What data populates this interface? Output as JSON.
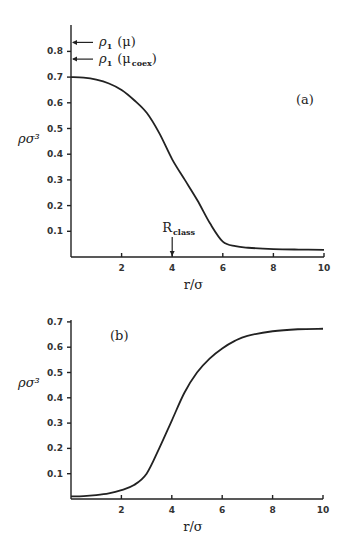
{
  "chart_data": [
    {
      "type": "line",
      "panel_label": "(a)",
      "xlabel": "r/σ",
      "ylabel": "ρσ³",
      "xlim": [
        0,
        10
      ],
      "ylim": [
        0,
        0.9
      ],
      "x_ticks": [
        2,
        4,
        6,
        8,
        10
      ],
      "y_ticks": [
        0.1,
        0.2,
        0.3,
        0.4,
        0.5,
        0.6,
        0.7,
        0.8
      ],
      "grid": false,
      "series": [
        {
          "name": "density profile (a)",
          "x": [
            0,
            0.5,
            1,
            1.5,
            2,
            2.5,
            3,
            3.5,
            4,
            4.5,
            5,
            5.5,
            6,
            6.5,
            7,
            8,
            9,
            10
          ],
          "values": [
            0.7,
            0.698,
            0.69,
            0.675,
            0.65,
            0.61,
            0.56,
            0.48,
            0.38,
            0.3,
            0.22,
            0.13,
            0.06,
            0.042,
            0.036,
            0.031,
            0.029,
            0.028
          ]
        }
      ],
      "annotations": [
        {
          "text": "ρ",
          "sub": "1",
          "suffix": "(μ)",
          "y": 0.835,
          "type": "arrow-left"
        },
        {
          "text": "ρ",
          "sub": "1",
          "suffix": "(μ",
          "suffix_sub": "coex",
          "suffix_end": ")",
          "y": 0.77,
          "type": "arrow-left"
        },
        {
          "text": "R",
          "sub": "class",
          "x": 4,
          "type": "arrow-down"
        }
      ]
    },
    {
      "type": "line",
      "panel_label": "(b)",
      "xlabel": "r/σ",
      "ylabel": "ρσ³",
      "xlim": [
        0,
        10
      ],
      "ylim": [
        0,
        0.7
      ],
      "x_ticks": [
        2,
        4,
        6,
        8,
        10
      ],
      "y_ticks": [
        0.1,
        0.2,
        0.3,
        0.4,
        0.5,
        0.6,
        0.7
      ],
      "grid": false,
      "series": [
        {
          "name": "density profile (b)",
          "x": [
            0,
            0.5,
            1,
            1.5,
            2,
            2.5,
            3,
            3.5,
            4,
            4.5,
            5,
            5.5,
            6,
            6.5,
            7,
            8,
            9,
            10
          ],
          "values": [
            0.01,
            0.011,
            0.015,
            0.022,
            0.035,
            0.055,
            0.1,
            0.2,
            0.31,
            0.42,
            0.5,
            0.555,
            0.595,
            0.625,
            0.645,
            0.663,
            0.671,
            0.673
          ]
        }
      ]
    }
  ]
}
